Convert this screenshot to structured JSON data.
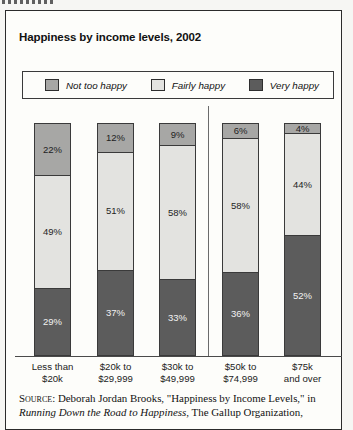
{
  "figure": {
    "title": "Happiness by income levels, 2002",
    "legend": [
      {
        "label": "Not too happy",
        "color": "#a7a7a5"
      },
      {
        "label": "Fairly happy",
        "color": "#e3e3e0"
      },
      {
        "label": "Very happy",
        "color": "#5c5c5c"
      }
    ],
    "source": {
      "prefix": "Source:",
      "text_before_italic": " Deborah Jordan Brooks, \"Happiness by Income Levels,\" in ",
      "italic_title": "Running Down the Road to Happiness",
      "text_after_italic": ", The Gallup Organization,"
    }
  },
  "chart_data": {
    "type": "bar",
    "stacked": true,
    "title": "Happiness by income levels, 2002",
    "categories": [
      [
        "Less than",
        "$20k"
      ],
      [
        "$20k to",
        "$29,999"
      ],
      [
        "$30k to",
        "$49,999"
      ],
      [
        "$50k to",
        "$74,999"
      ],
      [
        "$75k",
        "and over"
      ]
    ],
    "series": [
      {
        "name": "Not too happy",
        "color": "#a7a7a5",
        "text_color": "#1e1e1e",
        "values": [
          22,
          12,
          9,
          6,
          4
        ]
      },
      {
        "name": "Fairly happy",
        "color": "#e3e3e0",
        "text_color": "#1e1e1e",
        "values": [
          49,
          51,
          58,
          58,
          44
        ]
      },
      {
        "name": "Very happy",
        "color": "#5c5c5c",
        "text_color": "#f2f2f2",
        "values": [
          29,
          37,
          33,
          36,
          52
        ]
      }
    ],
    "value_suffix": "%",
    "ylim": [
      0,
      100
    ],
    "grid": false,
    "legend_position": "top",
    "group_divider_after_category": 3
  }
}
